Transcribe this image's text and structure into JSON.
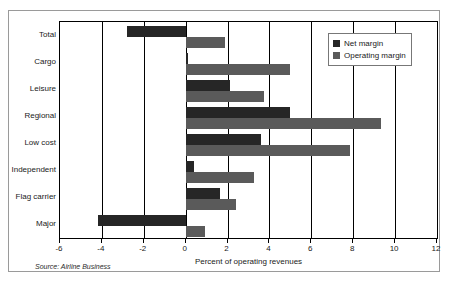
{
  "chart_data": {
    "type": "bar",
    "orientation": "horizontal",
    "title": "",
    "xlabel": "Percent of operating revenues",
    "ylabel": "",
    "xlim": [
      -6,
      12
    ],
    "xticks": [
      -6,
      -4,
      -2,
      0,
      2,
      4,
      6,
      8,
      10,
      12
    ],
    "xticklabels": [
      "-6",
      "-4",
      "-2",
      "0",
      "2",
      "4",
      "6",
      "8",
      "10",
      "12"
    ],
    "grid": true,
    "categories": [
      "Total",
      "Cargo",
      "Leisure",
      "Regional",
      "Low cost",
      "Independent",
      "Flag carrier",
      "Major"
    ],
    "series": [
      {
        "name": "Net margin",
        "color": "#262626",
        "values": [
          -2.8,
          0.1,
          2.1,
          5.0,
          3.6,
          0.4,
          1.65,
          -4.2
        ]
      },
      {
        "name": "Operating margin",
        "color": "#5a5a5a",
        "values": [
          1.9,
          5.0,
          3.75,
          9.35,
          7.85,
          3.25,
          2.4,
          0.9
        ]
      }
    ],
    "legend": {
      "position": "top-right",
      "entries": [
        "Net margin",
        "Operating margin"
      ]
    },
    "annotations": {
      "source": "Source: Airline Business"
    }
  }
}
